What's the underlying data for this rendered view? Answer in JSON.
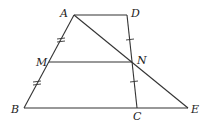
{
  "diagram": {
    "type": "geometry-trapezoid",
    "points": {
      "A": {
        "label": "A",
        "x": 74,
        "y": 15
      },
      "D": {
        "label": "D",
        "x": 127,
        "y": 15
      },
      "M": {
        "label": "M",
        "x": 49,
        "y": 62
      },
      "N": {
        "label": "N",
        "x": 132,
        "y": 62
      },
      "B": {
        "label": "B",
        "x": 24,
        "y": 108
      },
      "C": {
        "label": "C",
        "x": 137,
        "y": 108
      },
      "E": {
        "label": "E",
        "x": 188,
        "y": 108
      }
    },
    "segments": [
      "AD",
      "AB",
      "DC",
      "BE",
      "MN",
      "AE"
    ],
    "equal_marks": {
      "double": [
        "AM",
        "MB"
      ],
      "single": [
        "DN",
        "NC"
      ]
    }
  }
}
